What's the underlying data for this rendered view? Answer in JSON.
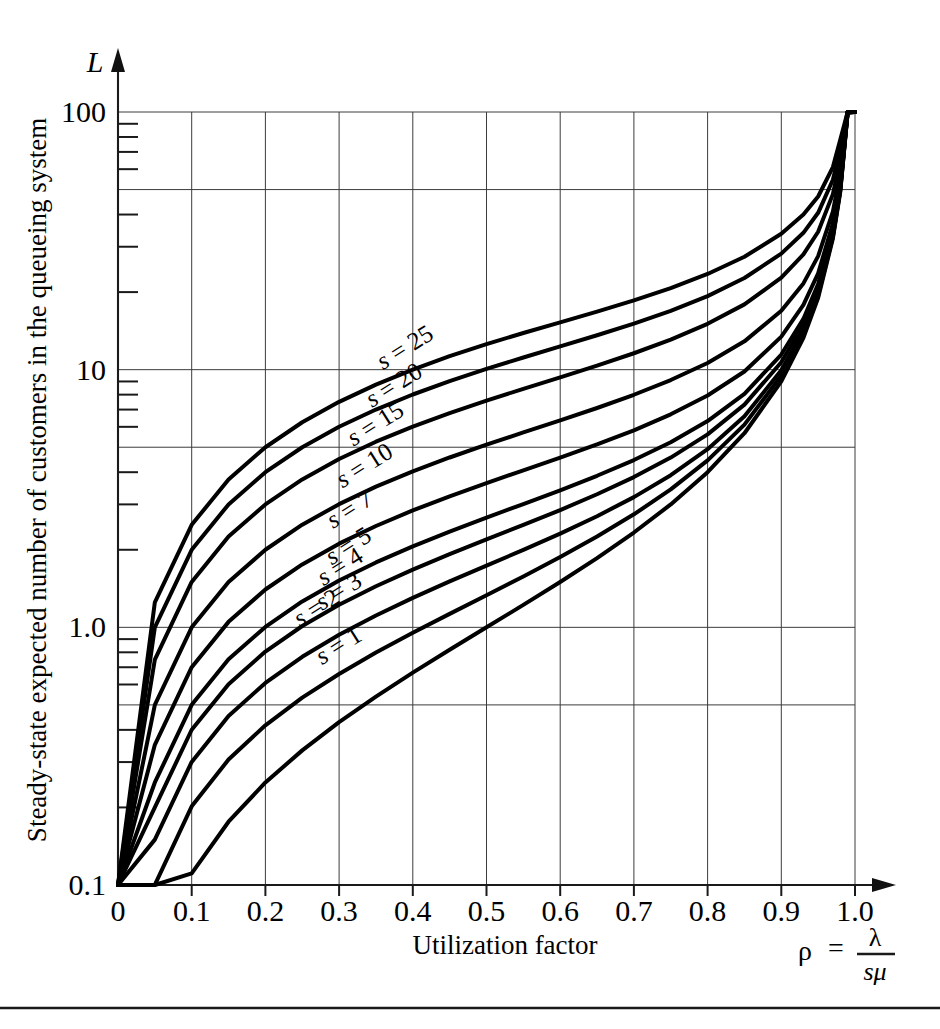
{
  "figure": {
    "y_axis_symbol": "L",
    "y_axis_title": "Steady-state expected number of customers in the queueing system",
    "x_axis_title": "Utilization factor",
    "formula": {
      "rho": "ρ",
      "equals": "=",
      "numerator": "λ",
      "denominator": "sμ"
    }
  },
  "chart_data": {
    "type": "line",
    "title": "",
    "subtitle": "",
    "xlabel": "Utilization factor",
    "ylabel": "Steady-state expected number of customers in the queueing system",
    "yaxis_symbol": "L",
    "xaxis_symbol": "ρ = λ / sμ",
    "xscale": "linear",
    "yscale": "log",
    "xlim": [
      0,
      1.0
    ],
    "ylim": [
      0.1,
      100
    ],
    "grid": true,
    "legend_position": "inline-curve-labels",
    "xticks": [
      0,
      0.1,
      0.2,
      0.3,
      0.4,
      0.5,
      0.6,
      0.7,
      0.8,
      0.9,
      1.0
    ],
    "xticklabels": [
      "0",
      "0.1",
      "0.2",
      "0.3",
      "0.4",
      "0.5",
      "0.6",
      "0.7",
      "0.8",
      "0.9",
      "1.0"
    ],
    "yticks": [
      0.1,
      1.0,
      10,
      100
    ],
    "yticklabels": [
      "0.1",
      "1.0",
      "10",
      "100"
    ],
    "y_gridlines": [
      0.1,
      0.5,
      1.0,
      5,
      10,
      50,
      100
    ],
    "y_minor_ticks": [
      0.2,
      0.3,
      0.4,
      0.6,
      0.7,
      0.8,
      0.9,
      2,
      3,
      4,
      6,
      7,
      8,
      9,
      20,
      30,
      40,
      60,
      70,
      80,
      90
    ],
    "x": [
      0.0,
      0.05,
      0.1,
      0.15,
      0.2,
      0.25,
      0.3,
      0.35,
      0.4,
      0.45,
      0.5,
      0.55,
      0.6,
      0.65,
      0.7,
      0.75,
      0.8,
      0.85,
      0.9,
      0.93,
      0.95,
      0.97,
      0.98,
      0.99,
      1.0
    ],
    "series": [
      {
        "name": "s = 1",
        "label": "s = 1",
        "s": 1,
        "values": [
          0.0,
          0.053,
          0.111,
          0.176,
          0.25,
          0.333,
          0.429,
          0.538,
          0.667,
          0.818,
          1.0,
          1.222,
          1.5,
          1.857,
          2.333,
          3.0,
          4.0,
          5.667,
          9.0,
          13.3,
          19.0,
          32.3,
          49.0,
          99.0,
          100
        ]
      },
      {
        "name": "s = 2",
        "label": "s = 2",
        "s": 2,
        "values": [
          0.0,
          0.1002,
          0.202,
          0.3069,
          0.4167,
          0.5333,
          0.6593,
          0.798,
          0.9524,
          1.128,
          1.333,
          1.576,
          1.875,
          2.253,
          2.745,
          3.429,
          4.444,
          6.121,
          9.474,
          13.75,
          19.49,
          32.79,
          49.49,
          99.5,
          100
        ]
      },
      {
        "name": "s = 3",
        "label": "s = 3",
        "s": 3,
        "values": [
          0.0,
          0.15,
          0.3005,
          0.4529,
          0.6083,
          0.7685,
          0.9354,
          1.112,
          1.301,
          1.507,
          1.736,
          1.998,
          2.31,
          2.7,
          3.201,
          3.893,
          4.913,
          6.593,
          9.948,
          14.22,
          19.96,
          33.26,
          49.96,
          99.97,
          100
        ]
      },
      {
        "name": "s = 4",
        "label": "s = 4",
        "s": 4,
        "values": [
          0.0,
          0.2,
          0.4004,
          0.6018,
          0.8053,
          1.012,
          1.224,
          1.443,
          1.675,
          1.922,
          2.193,
          2.498,
          2.852,
          3.284,
          3.829,
          4.558,
          5.61,
          7.314,
          10.69,
          14.97,
          20.71,
          34.01,
          50.71,
          100.7,
          100
        ]
      },
      {
        "name": "s = 5",
        "label": "s = 5",
        "s": 5,
        "values": [
          0.0,
          0.25,
          0.5003,
          0.7513,
          1.004,
          1.26,
          1.52,
          1.786,
          2.062,
          2.353,
          2.665,
          3.01,
          3.403,
          3.874,
          4.459,
          5.227,
          6.316,
          8.056,
          11.45,
          15.74,
          21.48,
          34.78,
          51.48,
          101.5,
          100
        ]
      },
      {
        "name": "s = 7",
        "label": "s = 7",
        "s": 7,
        "values": [
          0.0,
          0.35,
          0.7001,
          1.05,
          1.402,
          1.755,
          2.112,
          2.473,
          2.842,
          3.225,
          3.629,
          4.066,
          4.554,
          5.124,
          5.817,
          6.71,
          7.939,
          9.838,
          13.43,
          17.84,
          23.64,
          36.99,
          53.7,
          103.7,
          100
        ]
      },
      {
        "name": "s = 10",
        "label": "s = 10",
        "s": 10,
        "values": [
          0.0,
          0.5,
          1.0,
          1.5,
          2.0,
          2.502,
          3.006,
          3.515,
          4.031,
          4.562,
          5.115,
          5.706,
          6.356,
          7.101,
          7.991,
          9.113,
          10.62,
          12.88,
          16.92,
          21.62,
          27.58,
          41.09,
          57.83,
          107.9,
          100
        ]
      },
      {
        "name": "s = 15",
        "label": "s = 15",
        "s": 15,
        "values": [
          0.0,
          0.75,
          1.5,
          2.25,
          3.0,
          3.75,
          4.501,
          5.254,
          6.013,
          6.786,
          7.584,
          8.425,
          9.337,
          10.37,
          11.58,
          13.08,
          15.06,
          17.92,
          22.74,
          28.0,
          34.29,
          48.0,
          64.8,
          114.8,
          100
        ]
      },
      {
        "name": "s = 20",
        "label": "s = 20",
        "s": 20,
        "values": [
          0.0,
          1.0,
          2.0,
          3.0,
          4.0,
          5.0,
          6.001,
          7.003,
          8.01,
          9.027,
          10.07,
          11.15,
          12.31,
          13.6,
          15.09,
          16.92,
          19.3,
          22.68,
          28.21,
          33.97,
          40.62,
          54.56,
          71.44,
          121.4,
          100
        ]
      },
      {
        "name": "s = 25",
        "label": "s = 25",
        "s": 25,
        "values": [
          0.0,
          1.25,
          2.5,
          3.75,
          5.0,
          6.25,
          7.501,
          8.753,
          10.01,
          11.28,
          12.56,
          13.88,
          15.27,
          16.81,
          18.58,
          20.73,
          23.52,
          27.43,
          33.68,
          39.99,
          47.0,
          61.13,
          78.1,
          128.1,
          100
        ]
      }
    ],
    "curve_labels": [
      {
        "text": "s = 1",
        "x_frac": 0.305,
        "y_value": 0.8
      },
      {
        "text": "s = 2",
        "x_frac": 0.275,
        "y_value": 1.12
      },
      {
        "text": "s = 3",
        "x_frac": 0.305,
        "y_value": 1.3
      },
      {
        "text": "s = 4",
        "x_frac": 0.307,
        "y_value": 1.62
      },
      {
        "text": "s = 5",
        "x_frac": 0.318,
        "y_value": 1.95
      },
      {
        "text": "s = 7",
        "x_frac": 0.32,
        "y_value": 2.7
      },
      {
        "text": "s = 10",
        "x_frac": 0.34,
        "y_value": 4.0
      },
      {
        "text": "s = 15",
        "x_frac": 0.355,
        "y_value": 5.8
      },
      {
        "text": "s = 20",
        "x_frac": 0.38,
        "y_value": 8.2
      },
      {
        "text": "s = 25",
        "x_frac": 0.395,
        "y_value": 11.5
      }
    ]
  }
}
